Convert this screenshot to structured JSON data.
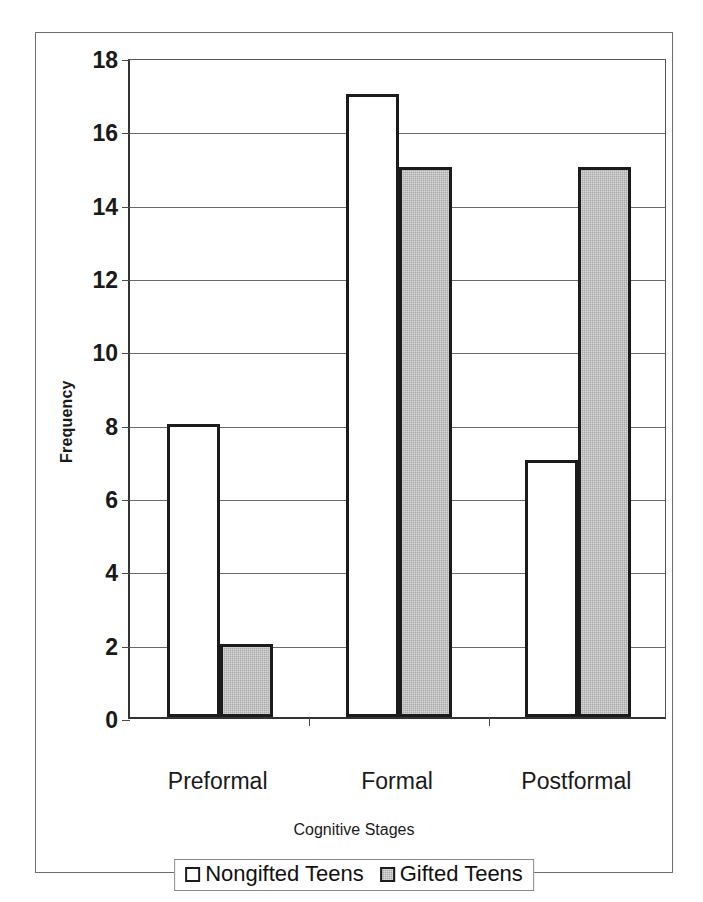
{
  "chart_data": {
    "type": "bar",
    "title": "",
    "xlabel": "Cognitive Stages",
    "ylabel": "Frequency",
    "categories": [
      "Preformal",
      "Formal",
      "Postformal"
    ],
    "series": [
      {
        "name": "Nongifted Teens",
        "values": [
          8,
          17,
          7
        ],
        "color": "#ffffff"
      },
      {
        "name": "Gifted Teens",
        "values": [
          2,
          15,
          15
        ],
        "color": "#a9a9a9"
      }
    ],
    "ylim": [
      0,
      18
    ],
    "ytick_step": 2,
    "yticks": [
      "18",
      "16",
      "14",
      "12",
      "10",
      "8",
      "6",
      "4",
      "2",
      "0"
    ],
    "grid": true,
    "legend_position": "bottom"
  },
  "axes": {
    "y_title": "Frequency",
    "x_title": "Cognitive Stages"
  },
  "legend": {
    "entries": [
      {
        "label": "Nongifted Teens",
        "swatch": "white-square-swatch"
      },
      {
        "label": "Gifted Teens",
        "swatch": "gray-square-swatch"
      }
    ]
  }
}
